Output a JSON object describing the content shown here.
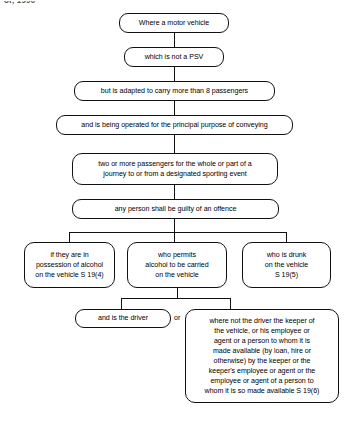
{
  "document": {
    "header_fragment": "of, 1990",
    "type": "legal flowchart",
    "subject": "Sporting Events (Control of Alcohol etc) offences S 19"
  },
  "flowchart": {
    "title": "Motor vehicle alcohol offence flowchart",
    "nodes": [
      {
        "id": "n1",
        "text": "Where a motor vehicle"
      },
      {
        "id": "n2",
        "text": "which is not a PSV"
      },
      {
        "id": "n3",
        "text": "but is adapted to carry more than 8 passengers"
      },
      {
        "id": "n4",
        "text": "and is being operated for the principal purpose of conveying"
      },
      {
        "id": "n5",
        "line1": "two or more passengers for the whole or part of a",
        "line2": "journey to or from a designated sporting event"
      },
      {
        "id": "n6",
        "text": "any person shall be guilty of an offence"
      },
      {
        "id": "n7",
        "line1": "if they are in",
        "line2": "possession of alcohol",
        "line3": "on the vehicle  S 19(4)"
      },
      {
        "id": "n8",
        "line1": "who permits",
        "line2": "alcohol to be carried",
        "line3": "on the vehicle"
      },
      {
        "id": "n9",
        "line1": "who is drunk",
        "line2": "on the vehicle",
        "line3": "S 19(5)"
      },
      {
        "id": "n10",
        "text": "and is the driver"
      },
      {
        "id": "n11",
        "line1": "where not the driver the keeper of",
        "line2": "the vehicle, or his employee or",
        "line3": "agent or a person to whom it is",
        "line4": "made available (by loan, hire or",
        "line5": "otherwise) by the keeper or the",
        "line6": "keeper's employee or agent or the",
        "line7": "employee or agent of a person to",
        "line8": "whom it is so made available S 19(6)"
      }
    ],
    "connectors": {
      "or_label": "or"
    },
    "colors": {
      "stroke": "#111111",
      "text": "#000000",
      "background": "#ffffff"
    }
  }
}
